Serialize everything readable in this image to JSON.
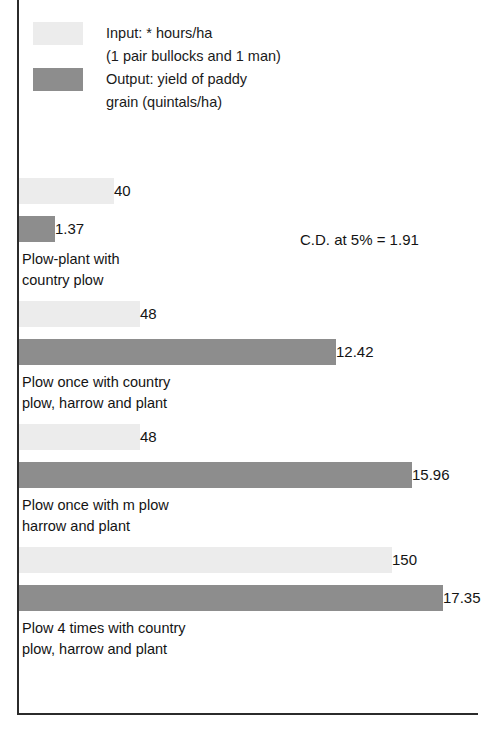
{
  "legend": {
    "items": [
      {
        "swatch": "light-gray-swatch",
        "color": "#ececec",
        "label": "Input: * hours/ha\n(1 pair bullocks and 1 man)"
      },
      {
        "swatch": "dark-gray-swatch",
        "color": "#8d8d8d",
        "label": "Output: yield of paddy\ngrain (quintals/ha)"
      }
    ]
  },
  "annotation": {
    "text": "C.D. at 5% = 1.91"
  },
  "groups": [
    {
      "label": "Plow-plant with\ncountry plow",
      "input_value": "40",
      "output_value": "1.37",
      "input_width": "95px",
      "output_width": "36px"
    },
    {
      "label": "Plow once with country\nplow, harrow and plant",
      "input_value": "48",
      "output_value": "12.42",
      "input_width": "121px",
      "output_width": "317px"
    },
    {
      "label": "Plow once with m plow\nharrow and plant",
      "input_value": "48",
      "output_value": "15.96",
      "input_width": "121px",
      "output_width": "393px"
    },
    {
      "label": "Plow 4 times with country\nplow, harrow and plant",
      "input_value": "150",
      "output_value": "17.35",
      "input_width": "373px",
      "output_width": "424px"
    }
  ],
  "chart_data": {
    "type": "bar",
    "orientation": "horizontal",
    "title": "",
    "xlabel": "",
    "ylabel": "",
    "grid": false,
    "legend_position": "top-left",
    "categories": [
      "Plow-plant with country plow",
      "Plow once with country plow, harrow and plant",
      "Plow once with m plow harrow and plant",
      "Plow 4 times with country plow, harrow and plant"
    ],
    "series": [
      {
        "name": "Input: * hours/ha (1 pair bullocks and 1 man)",
        "unit": "hours/ha",
        "color": "#ececec",
        "values": [
          40,
          48,
          48,
          150
        ]
      },
      {
        "name": "Output: yield of paddy grain (quintals/ha)",
        "unit": "quintals/ha",
        "color": "#8d8d8d",
        "values": [
          1.37,
          12.42,
          15.96,
          17.35
        ]
      }
    ],
    "annotations": [
      "C.D. at 5% = 1.91"
    ]
  }
}
